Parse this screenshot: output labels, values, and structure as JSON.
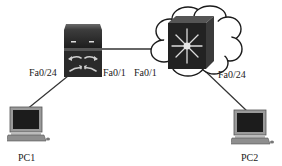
{
  "diagram": {
    "type": "network-topology",
    "nodes": [
      {
        "id": "sw1",
        "kind": "layer2-switch",
        "label": ""
      },
      {
        "id": "msw",
        "kind": "multilayer-switch-in-cloud",
        "label": ""
      },
      {
        "id": "pc1",
        "kind": "pc",
        "label": "PC1"
      },
      {
        "id": "pc2",
        "kind": "pc",
        "label": "PC2"
      }
    ],
    "links": [
      {
        "from": "sw1",
        "to": "msw",
        "from_port": "Fa0/1",
        "to_port": "Fa0/1"
      },
      {
        "from": "sw1",
        "to": "pc1",
        "from_port": "Fa0/24"
      },
      {
        "from": "msw",
        "to": "pc2",
        "from_port": "Fa0/24"
      }
    ]
  },
  "labels": {
    "sw1_fa024": "Fa0/24",
    "sw1_fa01": "Fa0/1",
    "msw_fa01": "Fa0/1",
    "msw_fa024": "Fa0/24",
    "pc1": "PC1",
    "pc2": "PC2"
  },
  "colors": {
    "link": "#333333",
    "device_dark": "#2a2a2a",
    "cloud_outline": "#1a1a1a",
    "background": "#ffffff"
  }
}
